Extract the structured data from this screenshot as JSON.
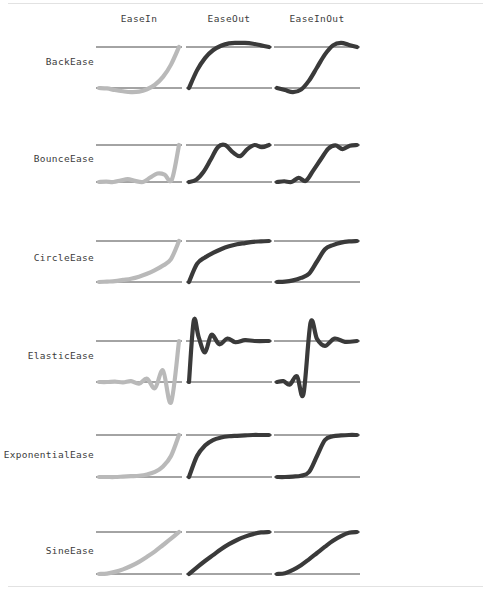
{
  "page": {
    "background_color": "#ffffff",
    "rule_color": "#e2e2e2"
  },
  "colors": {
    "ease_in_curve": "#b9b9b9",
    "ease_out_curve": "#3a3a3a",
    "ease_in_out_curve": "#3a3a3a",
    "guide_line": "#1a1a1a",
    "label_text": "#3c3c3c"
  },
  "columns": [
    {
      "key": "easein",
      "label": "EaseIn",
      "x": 96,
      "width": 86,
      "center": 139
    },
    {
      "key": "easeout",
      "label": "EaseOut",
      "x": 186,
      "width": 86,
      "center": 229
    },
    {
      "key": "easeinout",
      "label": "EaseInOut",
      "x": 274,
      "width": 86,
      "center": 317
    }
  ],
  "rows": [
    {
      "key": "back",
      "label": "BackEase",
      "top_line_y": 47,
      "bottom_line_y": 88,
      "label_y": 62
    },
    {
      "key": "bounce",
      "label": "BounceEase",
      "top_line_y": 145,
      "bottom_line_y": 182,
      "label_y": 159
    },
    {
      "key": "circle",
      "label": "CircleEase",
      "top_line_y": 241,
      "bottom_line_y": 282,
      "label_y": 258
    },
    {
      "key": "elastic",
      "label": "ElasticEase",
      "top_line_y": 341,
      "bottom_line_y": 382,
      "label_y": 356
    },
    {
      "key": "exponential",
      "label": "ExponentialEase",
      "top_line_y": 435,
      "bottom_line_y": 477,
      "label_y": 455
    },
    {
      "key": "sine",
      "label": "SineEase",
      "top_line_y": 532,
      "bottom_line_y": 574,
      "label_y": 551
    }
  ],
  "chart_data": {
    "type": "line",
    "xlabel": "",
    "ylabel": "",
    "xlim": [
      0,
      1
    ],
    "ylim": [
      0,
      1
    ],
    "grid": false,
    "legend_position": "none",
    "note": "6 easing families x 3 variants; each cell plots normalized progress (x 0..1) against eased value (y 0..1). Top guide line = 1, bottom guide line = 0. Values overshooting below 0 or above 1 are drawn outside the guide lines.",
    "series": [
      {
        "name": "BackEase / EaseIn",
        "row": "back",
        "column": "easein",
        "color": "#b9b9b9",
        "x": [
          0.0,
          0.1,
          0.2,
          0.3,
          0.4,
          0.5,
          0.6,
          0.7,
          0.8,
          0.9,
          1.0
        ],
        "y": [
          0.0,
          -0.01,
          -0.05,
          -0.08,
          -0.1,
          -0.09,
          -0.03,
          0.08,
          0.27,
          0.57,
          1.0
        ]
      },
      {
        "name": "BackEase / EaseOut",
        "row": "back",
        "column": "easeout",
        "color": "#3a3a3a",
        "x": [
          0.0,
          0.1,
          0.2,
          0.3,
          0.4,
          0.5,
          0.6,
          0.7,
          0.8,
          0.9,
          1.0
        ],
        "y": [
          0.0,
          0.43,
          0.73,
          0.92,
          1.03,
          1.09,
          1.1,
          1.1,
          1.08,
          1.04,
          1.0
        ]
      },
      {
        "name": "BackEase / EaseInOut",
        "row": "back",
        "column": "easeinout",
        "color": "#3a3a3a",
        "x": [
          0.0,
          0.1,
          0.2,
          0.3,
          0.4,
          0.5,
          0.6,
          0.7,
          0.8,
          0.9,
          1.0
        ],
        "y": [
          0.0,
          -0.05,
          -0.1,
          -0.04,
          0.18,
          0.5,
          0.82,
          1.04,
          1.1,
          1.05,
          1.0
        ]
      },
      {
        "name": "BounceEase / EaseIn",
        "row": "bounce",
        "column": "easein",
        "color": "#b9b9b9",
        "x": [
          0.0,
          0.09,
          0.18,
          0.27,
          0.36,
          0.45,
          0.55,
          0.64,
          0.73,
          0.82,
          0.91,
          1.0
        ],
        "y": [
          0.0,
          0.01,
          0.0,
          0.04,
          0.08,
          0.03,
          0.0,
          0.12,
          0.23,
          0.2,
          0.06,
          1.0
        ]
      },
      {
        "name": "BounceEase / EaseOut",
        "row": "bounce",
        "column": "easeout",
        "color": "#3a3a3a",
        "x": [
          0.0,
          0.09,
          0.18,
          0.27,
          0.36,
          0.45,
          0.55,
          0.64,
          0.73,
          0.82,
          0.91,
          1.0
        ],
        "y": [
          0.0,
          0.06,
          0.27,
          0.6,
          0.94,
          1.0,
          0.8,
          0.7,
          0.89,
          1.0,
          0.94,
          1.0
        ]
      },
      {
        "name": "BounceEase / EaseInOut",
        "row": "bounce",
        "column": "easeinout",
        "color": "#3a3a3a",
        "x": [
          0.0,
          0.09,
          0.18,
          0.27,
          0.36,
          0.45,
          0.55,
          0.64,
          0.73,
          0.82,
          0.91,
          1.0
        ],
        "y": [
          0.0,
          0.02,
          0.0,
          0.11,
          0.03,
          0.3,
          0.62,
          0.9,
          0.99,
          0.89,
          0.98,
          1.0
        ]
      },
      {
        "name": "CircleEase / EaseIn",
        "row": "circle",
        "column": "easein",
        "color": "#b9b9b9",
        "x": [
          0.0,
          0.1,
          0.2,
          0.3,
          0.4,
          0.5,
          0.6,
          0.7,
          0.8,
          0.9,
          1.0
        ],
        "y": [
          0.0,
          0.01,
          0.02,
          0.05,
          0.08,
          0.13,
          0.2,
          0.29,
          0.4,
          0.56,
          1.0
        ]
      },
      {
        "name": "CircleEase / EaseOut",
        "row": "circle",
        "column": "easeout",
        "color": "#3a3a3a",
        "x": [
          0.0,
          0.1,
          0.2,
          0.3,
          0.4,
          0.5,
          0.6,
          0.7,
          0.8,
          0.9,
          1.0
        ],
        "y": [
          0.0,
          0.44,
          0.6,
          0.71,
          0.8,
          0.87,
          0.92,
          0.95,
          0.98,
          0.99,
          1.0
        ]
      },
      {
        "name": "CircleEase / EaseInOut",
        "row": "circle",
        "column": "easeinout",
        "color": "#3a3a3a",
        "x": [
          0.0,
          0.1,
          0.2,
          0.3,
          0.4,
          0.5,
          0.6,
          0.7,
          0.8,
          0.9,
          1.0
        ],
        "y": [
          0.0,
          0.01,
          0.04,
          0.1,
          0.2,
          0.5,
          0.8,
          0.9,
          0.96,
          0.99,
          1.0
        ]
      },
      {
        "name": "ElasticEase / EaseIn",
        "row": "elastic",
        "column": "easein",
        "color": "#b9b9b9",
        "x": [
          0.0,
          0.1,
          0.2,
          0.3,
          0.4,
          0.5,
          0.6,
          0.7,
          0.8,
          0.9,
          1.0
        ],
        "y": [
          0.0,
          0.0,
          0.01,
          -0.01,
          0.02,
          -0.04,
          0.08,
          -0.15,
          0.28,
          -0.5,
          1.0
        ]
      },
      {
        "name": "ElasticEase / EaseOut",
        "row": "elastic",
        "column": "easeout",
        "color": "#3a3a3a",
        "x": [
          0.0,
          0.06,
          0.12,
          0.2,
          0.28,
          0.38,
          0.48,
          0.58,
          0.7,
          0.82,
          1.0
        ],
        "y": [
          0.0,
          1.5,
          1.1,
          0.72,
          1.15,
          0.92,
          1.06,
          0.97,
          1.02,
          1.0,
          1.0
        ]
      },
      {
        "name": "ElasticEase / EaseInOut",
        "row": "elastic",
        "column": "easeinout",
        "color": "#3a3a3a",
        "x": [
          0.0,
          0.08,
          0.16,
          0.25,
          0.33,
          0.42,
          0.5,
          0.6,
          0.72,
          0.85,
          1.0
        ],
        "y": [
          0.0,
          0.02,
          -0.06,
          0.14,
          -0.3,
          1.45,
          1.05,
          0.88,
          1.06,
          0.98,
          1.0
        ]
      },
      {
        "name": "ExponentialEase / EaseIn",
        "row": "exponential",
        "column": "easein",
        "color": "#b9b9b9",
        "x": [
          0.0,
          0.1,
          0.2,
          0.3,
          0.4,
          0.5,
          0.6,
          0.7,
          0.8,
          0.9,
          1.0
        ],
        "y": [
          0.0,
          0.0,
          0.0,
          0.01,
          0.02,
          0.03,
          0.06,
          0.12,
          0.25,
          0.5,
          1.0
        ]
      },
      {
        "name": "ExponentialEase / EaseOut",
        "row": "exponential",
        "column": "easeout",
        "color": "#3a3a3a",
        "x": [
          0.0,
          0.1,
          0.2,
          0.3,
          0.4,
          0.5,
          0.6,
          0.7,
          0.8,
          0.9,
          1.0
        ],
        "y": [
          0.0,
          0.5,
          0.75,
          0.88,
          0.94,
          0.97,
          0.98,
          0.99,
          1.0,
          1.0,
          1.0
        ]
      },
      {
        "name": "ExponentialEase / EaseInOut",
        "row": "exponential",
        "column": "easeinout",
        "color": "#3a3a3a",
        "x": [
          0.0,
          0.1,
          0.2,
          0.3,
          0.4,
          0.5,
          0.6,
          0.7,
          0.8,
          0.9,
          1.0
        ],
        "y": [
          0.0,
          0.0,
          0.01,
          0.03,
          0.12,
          0.5,
          0.88,
          0.97,
          0.99,
          1.0,
          1.0
        ]
      },
      {
        "name": "SineEase / EaseIn",
        "row": "sine",
        "column": "easein",
        "color": "#b9b9b9",
        "x": [
          0.0,
          0.1,
          0.2,
          0.3,
          0.4,
          0.5,
          0.6,
          0.7,
          0.8,
          0.9,
          1.0
        ],
        "y": [
          0.0,
          0.01,
          0.05,
          0.11,
          0.19,
          0.29,
          0.41,
          0.54,
          0.69,
          0.84,
          1.0
        ]
      },
      {
        "name": "SineEase / EaseOut",
        "row": "sine",
        "column": "easeout",
        "color": "#3a3a3a",
        "x": [
          0.0,
          0.1,
          0.2,
          0.3,
          0.4,
          0.5,
          0.6,
          0.7,
          0.8,
          0.9,
          1.0
        ],
        "y": [
          0.0,
          0.16,
          0.31,
          0.45,
          0.59,
          0.71,
          0.81,
          0.89,
          0.95,
          0.99,
          1.0
        ]
      },
      {
        "name": "SineEase / EaseInOut",
        "row": "sine",
        "column": "easeinout",
        "color": "#3a3a3a",
        "x": [
          0.0,
          0.1,
          0.2,
          0.3,
          0.4,
          0.5,
          0.6,
          0.7,
          0.8,
          0.9,
          1.0
        ],
        "y": [
          0.0,
          0.02,
          0.1,
          0.21,
          0.35,
          0.5,
          0.65,
          0.79,
          0.9,
          0.98,
          1.0
        ]
      }
    ]
  }
}
